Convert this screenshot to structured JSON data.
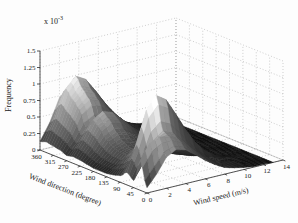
{
  "figure": {
    "background": "#fdfdfd",
    "zlabel": "Frequency",
    "xlabel": "Wind speed (m/s)",
    "ylabel": "Wind direction (degree)",
    "z_exponent": {
      "base": "x 10",
      "sup": "-3"
    }
  },
  "chart_data": {
    "type": "surface",
    "title": "",
    "colormap": "gray",
    "grid": true,
    "view": {
      "azimuth": -37.5,
      "elevation": 30
    },
    "axes": {
      "speed": {
        "label": "Wind speed (m/s)",
        "ticks": [
          0,
          2,
          4,
          6,
          8,
          10,
          12,
          14
        ],
        "range": [
          0,
          14
        ]
      },
      "direction": {
        "label": "Wind direction (degree)",
        "ticks": [
          360,
          315,
          270,
          225,
          180,
          135,
          90,
          45,
          0
        ],
        "range": [
          0,
          360
        ]
      },
      "frequency": {
        "label": "Frequency",
        "ticks": [
          0,
          0.25,
          0.5,
          0.75,
          1,
          1.25,
          1.5
        ],
        "scale": "1e-3",
        "range": [
          0,
          0.0015
        ]
      }
    },
    "colors": {
      "surface_low": "#0f0f0f",
      "surface_high": "#f2f2f2",
      "grid_line": "#b9b9b9",
      "axis_line": "#2a2a2a"
    },
    "directions_deg": [
      0,
      22.5,
      45,
      67.5,
      90,
      112.5,
      135,
      157.5,
      180,
      202.5,
      225,
      247.5,
      270,
      292.5,
      315,
      337.5,
      360
    ],
    "speeds_ms": [
      0,
      1,
      2,
      3,
      4,
      5,
      6,
      7,
      8,
      9,
      10,
      11,
      12,
      13
    ],
    "frequency_x1e3": [
      [
        0.08,
        0.25,
        0.47,
        0.55,
        0.51,
        0.4,
        0.28,
        0.18,
        0.1,
        0.06,
        0.03,
        0.01,
        0.01,
        0
      ],
      [
        0.45,
        0.68,
        0.72,
        0.7,
        0.62,
        0.48,
        0.34,
        0.21,
        0.12,
        0.07,
        0.03,
        0.01,
        0.01,
        0
      ],
      [
        0.11,
        0.34,
        0.64,
        0.75,
        0.69,
        0.54,
        0.38,
        0.24,
        0.14,
        0.08,
        0.04,
        0.02,
        0.01,
        0
      ],
      [
        0.19,
        0.56,
        1.06,
        1.25,
        1.15,
        0.9,
        0.63,
        0.4,
        0.23,
        0.13,
        0.06,
        0.03,
        0.01,
        0
      ],
      [
        0.1,
        0.29,
        0.55,
        0.65,
        0.6,
        0.47,
        0.33,
        0.21,
        0.12,
        0.07,
        0.03,
        0.01,
        0.01,
        0
      ],
      [
        0.07,
        0.2,
        0.38,
        0.45,
        0.41,
        0.32,
        0.23,
        0.14,
        0.08,
        0.05,
        0.02,
        0.01,
        0,
        0
      ],
      [
        0.05,
        0.14,
        0.26,
        0.3,
        0.28,
        0.22,
        0.15,
        0.1,
        0.05,
        0.03,
        0.02,
        0.01,
        0,
        0
      ],
      [
        0.05,
        0.14,
        0.26,
        0.3,
        0.28,
        0.22,
        0.15,
        0.1,
        0.05,
        0.03,
        0.02,
        0.01,
        0,
        0
      ],
      [
        0.05,
        0.16,
        0.3,
        0.35,
        0.32,
        0.25,
        0.18,
        0.11,
        0.06,
        0.04,
        0.02,
        0.01,
        0,
        0
      ],
      [
        0.07,
        0.2,
        0.38,
        0.45,
        0.41,
        0.32,
        0.23,
        0.14,
        0.08,
        0.05,
        0.02,
        0.01,
        0,
        0
      ],
      [
        0.09,
        0.27,
        0.51,
        0.6,
        0.55,
        0.43,
        0.3,
        0.19,
        0.11,
        0.06,
        0.03,
        0.01,
        0.01,
        0
      ],
      [
        0.1,
        0.31,
        0.58,
        0.68,
        0.63,
        0.49,
        0.34,
        0.22,
        0.12,
        0.07,
        0.03,
        0.01,
        0.01,
        0
      ],
      [
        0.08,
        0.23,
        0.43,
        0.5,
        0.46,
        0.36,
        0.25,
        0.16,
        0.09,
        0.05,
        0.03,
        0.01,
        0.01,
        0
      ],
      [
        0.12,
        0.35,
        0.66,
        0.78,
        0.72,
        0.56,
        0.39,
        0.25,
        0.14,
        0.08,
        0.04,
        0.02,
        0.01,
        0
      ],
      [
        0.14,
        0.41,
        0.77,
        0.9,
        0.83,
        0.65,
        0.45,
        0.29,
        0.16,
        0.09,
        0.05,
        0.02,
        0.01,
        0
      ],
      [
        0.16,
        0.47,
        0.89,
        1.05,
        0.97,
        0.76,
        0.53,
        0.34,
        0.19,
        0.11,
        0.05,
        0.02,
        0.01,
        0
      ],
      [
        0.13,
        0.38,
        0.72,
        0.85,
        0.78,
        0.61,
        0.43,
        0.27,
        0.15,
        0.09,
        0.04,
        0.02,
        0.01,
        0
      ]
    ]
  }
}
